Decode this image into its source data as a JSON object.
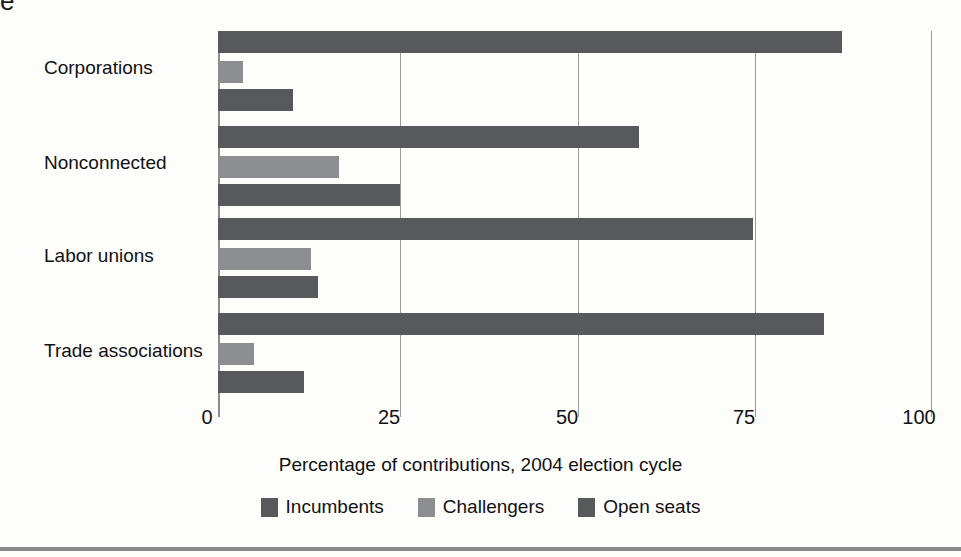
{
  "page": {
    "clipped_text_fragment": "e"
  },
  "chart_data": {
    "type": "bar",
    "orientation": "horizontal",
    "title": "",
    "xlabel": "Percentage of contributions, 2004 election cycle",
    "ylabel": "",
    "xlim": [
      0,
      100
    ],
    "xticks": [
      "0",
      "25",
      "50",
      "75",
      "100"
    ],
    "grid": "vertical gridlines at 25, 50, 75, 100",
    "legend_position": "bottom-center",
    "categories": [
      "Corporations",
      "Nonconnected",
      "Labor unions",
      "Trade associations"
    ],
    "series": [
      {
        "name": "Incumbents",
        "color": "#58595b",
        "values": [
          87.5,
          59,
          75,
          85
        ]
      },
      {
        "name": "Challengers",
        "color": "#8d8e90",
        "values": [
          3.5,
          17,
          13,
          5
        ]
      },
      {
        "name": "Open seats",
        "color": "#58595b",
        "values": [
          10.5,
          25.5,
          14,
          12
        ]
      }
    ]
  },
  "axis": {
    "tick_0": "0",
    "tick_25": "25",
    "tick_50": "50",
    "tick_75": "75",
    "tick_100": "100",
    "title": "Percentage of contributions, 2004 election cycle"
  },
  "legend": {
    "items": [
      {
        "label": "Incumbents",
        "color": "#58595b"
      },
      {
        "label": "Challengers",
        "color": "#8d8e90"
      },
      {
        "label": "Open seats",
        "color": "#58595b"
      }
    ]
  },
  "category_labels": {
    "corporations": "Corporations",
    "nonconnected": "Nonconnected",
    "labor_unions": "Labor unions",
    "trade_associations": "Trade associations"
  }
}
